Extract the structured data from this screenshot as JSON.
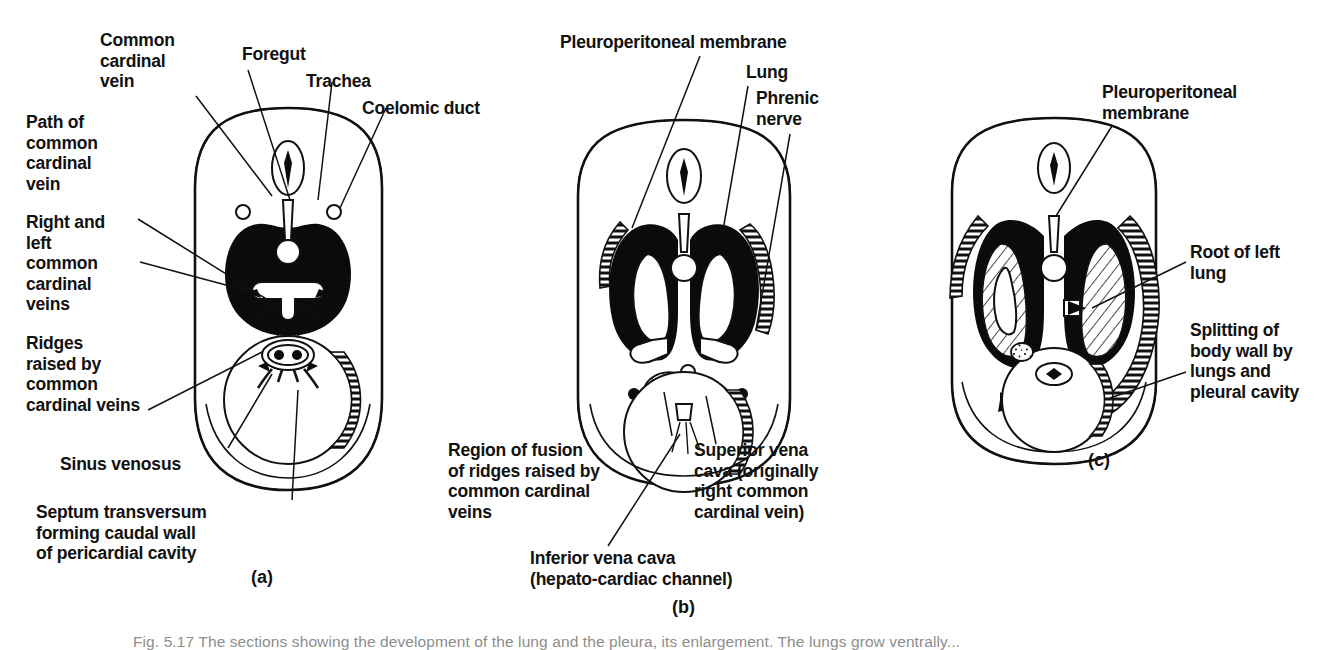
{
  "figure": {
    "caption_clipped": "Fig. 5.17   The sections showing the development of the lung and the pleura, its enlargement. The lungs grow ventrally...",
    "background_color": "#ffffff",
    "ink_color": "#111111"
  },
  "panels": [
    {
      "id": "a",
      "letter_label": "(a)"
    },
    {
      "id": "b",
      "letter_label": "(b)"
    },
    {
      "id": "c",
      "letter_label": "(c)"
    }
  ],
  "panel_a": {
    "labels": [
      {
        "name": "common-cardinal-vein",
        "text": "Common\ncardinal\nvein"
      },
      {
        "name": "foregut",
        "text": "Foregut"
      },
      {
        "name": "trachea",
        "text": "Trachea"
      },
      {
        "name": "coelomic-duct",
        "text": "Coelomic duct"
      },
      {
        "name": "path-of-common-cardinal-vein",
        "text": "Path of\ncommon\ncardinal\nvein"
      },
      {
        "name": "right-and-left-common-cardinal-veins",
        "text": "Right and\nleft\ncommon\ncardinal\nveins"
      },
      {
        "name": "ridges-raised-by-common-cardinal-veins",
        "text": "Ridges\nraised by\ncommon\ncardinal veins"
      },
      {
        "name": "sinus-venosus",
        "text": "Sinus venosus"
      },
      {
        "name": "septum-transversum",
        "text": "Septum transversum\nforming caudal wall\nof pericardial cavity"
      }
    ]
  },
  "panel_b": {
    "labels": [
      {
        "name": "pleuroperitoneal-membrane",
        "text": "Pleuroperitoneal membrane"
      },
      {
        "name": "lung",
        "text": "Lung"
      },
      {
        "name": "phrenic-nerve",
        "text": "Phrenic\nnerve"
      },
      {
        "name": "region-of-fusion-of-ridges",
        "text": "Region of fusion\nof ridges raised by\ncommon cardinal\nveins"
      },
      {
        "name": "superior-vena-cava",
        "text": "Superior vena\ncava (originally\nright  common\ncardinal vein)"
      },
      {
        "name": "inferior-vena-cava",
        "text": "Inferior vena cava\n(hepato-cardiac channel)"
      }
    ]
  },
  "panel_c": {
    "labels": [
      {
        "name": "pleuroperitoneal-membrane",
        "text": "Pleuroperitoneal\nmembrane"
      },
      {
        "name": "root-of-left-lung",
        "text": "Root of left\nlung"
      },
      {
        "name": "splitting-of-body-wall",
        "text": "Splitting of\nbody wall by\nlungs and\npleural cavity"
      }
    ]
  }
}
